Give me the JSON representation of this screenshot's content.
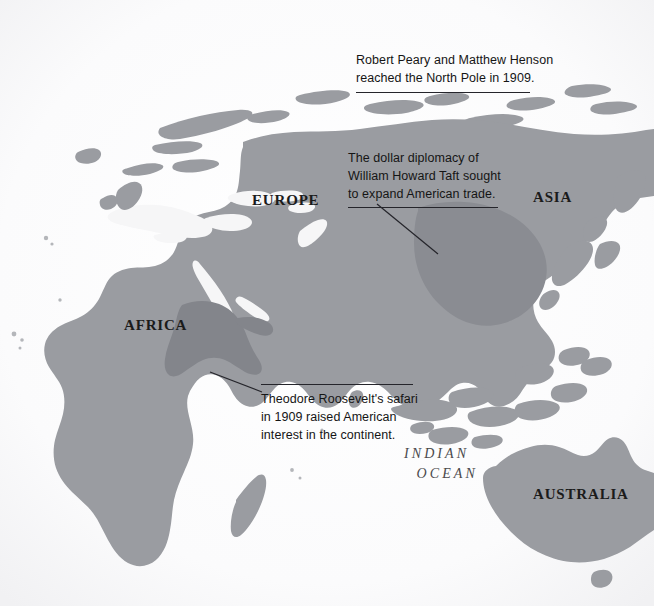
{
  "page": {
    "width": 654,
    "height": 606,
    "background_color": "#f8f8f9",
    "land_color": "#9a9ca1",
    "land_highlight_color": "#83858b",
    "text_color": "#151515",
    "rule_color": "#25252b",
    "ocean_label_color": "#4a4a4c"
  },
  "continent_labels": [
    {
      "id": "europe",
      "text": "EUROPE",
      "x": 252,
      "y": 193,
      "font_size": 15
    },
    {
      "id": "asia",
      "text": "ASIA",
      "x": 533,
      "y": 190,
      "font_size": 15
    },
    {
      "id": "africa",
      "text": "AFRICA",
      "x": 124,
      "y": 318,
      "font_size": 15
    },
    {
      "id": "australia",
      "text": "AUSTRALIA",
      "x": 533,
      "y": 487,
      "font_size": 15
    }
  ],
  "ocean_labels": [
    {
      "id": "indian-ocean",
      "line_1": "INDIAN",
      "line_2": "OCEAN",
      "x": 404,
      "y": 444,
      "font_size": 14
    }
  ],
  "annotations": [
    {
      "id": "north-pole",
      "lines": [
        "Robert Peary and Matthew Henson",
        "reached the North Pole in 1909."
      ],
      "x": 356,
      "y": 52,
      "rule_width": 174,
      "leader": {
        "x1": 356,
        "y1": 88,
        "x2": 356,
        "y2": 88
      }
    },
    {
      "id": "dollar-diplomacy",
      "lines": [
        "The dollar diplomacy of",
        "William Howard Taft sought",
        "to expand American trade."
      ],
      "x": 348,
      "y": 150,
      "rule_width": 150,
      "leader": {
        "x1": 376,
        "y1": 203,
        "x2": 438,
        "y2": 253
      }
    },
    {
      "id": "roosevelt-safari",
      "lines": [
        "Theodore Roosevelt's safari",
        "in 1909 raised American",
        "interest in the continent."
      ],
      "x": 261,
      "y": 398,
      "rule_width": 152,
      "leader": {
        "x1": 261,
        "y1": 391,
        "x2": 216,
        "y2": 374
      }
    }
  ],
  "map_regions": [
    {
      "id": "eurasia-africa-mainland",
      "name": "Eurasia and Africa landmass",
      "shade": "base"
    },
    {
      "id": "east-africa-highlight",
      "name": "East Africa safari region",
      "shade": "highlight"
    },
    {
      "id": "china-highlight",
      "name": "China trade region",
      "shade": "highlight"
    },
    {
      "id": "australia",
      "name": "Australia",
      "shade": "base"
    },
    {
      "id": "scandinavia-arctic-islands",
      "name": "Arctic islands and Scandinavia",
      "shade": "base"
    },
    {
      "id": "japan",
      "name": "Japan",
      "shade": "base"
    },
    {
      "id": "indonesia-philippines",
      "name": "Indonesia and Philippines archipelago",
      "shade": "base"
    },
    {
      "id": "madagascar",
      "name": "Madagascar",
      "shade": "base"
    },
    {
      "id": "sri-lanka",
      "name": "Sri Lanka",
      "shade": "base"
    },
    {
      "id": "british-isles",
      "name": "British Isles",
      "shade": "base"
    },
    {
      "id": "tasmania",
      "name": "Tasmania",
      "shade": "base"
    }
  ]
}
